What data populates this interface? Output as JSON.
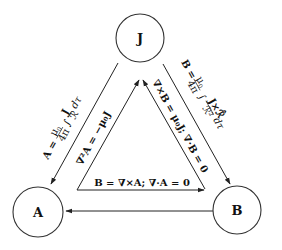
{
  "diagram": {
    "nodes": [
      {
        "id": "J",
        "label": "J"
      },
      {
        "id": "A",
        "label": "A"
      },
      {
        "id": "B",
        "label": "B"
      }
    ],
    "edges": {
      "j_to_a": {
        "from": "J",
        "to": "A",
        "label": "A = μ₀/4π ∫ J/ℛ dτ"
      },
      "a_to_j": {
        "from": "A",
        "to": "J",
        "label": "∇²A = −μ₀J"
      },
      "j_to_b": {
        "from": "J",
        "to": "B",
        "label": "B = μ₀/4π ∫ J×ℛ̂/ℛ² dτ"
      },
      "b_to_j": {
        "from": "B",
        "to": "J",
        "label": "∇×B = μ₀J; ∇·B = 0"
      },
      "a_to_b": {
        "from": "A",
        "to": "B",
        "label": "B = ∇×A; ∇·A = 0"
      },
      "b_to_a": {
        "from": "B",
        "to": "A",
        "label": ""
      }
    },
    "text": {
      "ja_lhs": "A = ",
      "ja_mu": "μ",
      "ja_mu_sub": "0",
      "ja_4pi": "4π",
      "ja_int": "∫",
      "ja_J": "J",
      "ja_r": "ℛ",
      "ja_dtau": "dτ",
      "aj_text": "∇²A = −μ₀J",
      "jb_lhs": "B = ",
      "jb_mu": "μ",
      "jb_mu_sub": "0",
      "jb_4pi": "4π",
      "jb_int": "∫",
      "jb_num": "J×ℛ̂",
      "jb_den": "ℛ²",
      "jb_dtau": "dτ",
      "bj_text": "∇×B = μ₀J; ∇·B = 0",
      "ab_text": "B = ∇×A; ∇·A = 0"
    }
  }
}
